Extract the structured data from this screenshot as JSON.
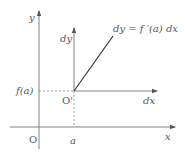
{
  "diagram": {
    "type": "differential-geometry",
    "colors": {
      "axis": "#777777",
      "line": "#333333",
      "dash": "#888888",
      "text": "#555555"
    },
    "axes": {
      "main_x": {
        "label": "x",
        "x1": 10,
        "x2": 175,
        "y": 127
      },
      "main_y": {
        "label": "y",
        "x": 39,
        "y1": 148,
        "y2": 10
      },
      "local_x": {
        "label": "dx",
        "x1": 39,
        "x2": 157,
        "y": 91
      },
      "local_y": {
        "label": "dy",
        "x": 74,
        "y1": 127,
        "y2": 28
      }
    },
    "labels": {
      "origin": "O",
      "local_origin": "O'",
      "point_a": "a",
      "f_of_a": "f(a)",
      "tangent_eq": "dy = f ′(a) dx"
    },
    "tangent_line": {
      "x1": 74,
      "y1": 91,
      "x2": 113,
      "y2": 36
    }
  }
}
